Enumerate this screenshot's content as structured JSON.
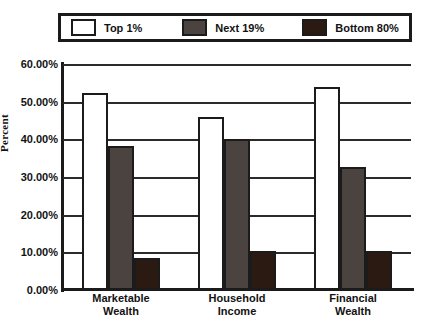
{
  "title_sliver": "Comparison",
  "legend": {
    "position": "top",
    "entries": [
      {
        "label": "Top 1%",
        "color": "#ffffff"
      },
      {
        "label": "Next 19%",
        "color": "#4a4340"
      },
      {
        "label": "Bottom 80%",
        "color": "#2a1a12"
      }
    ]
  },
  "axis": {
    "ylabel": "Percent",
    "yticks": [
      "60.00%",
      "50.00%",
      "40.00%",
      "30.00%",
      "20.00%",
      "10.00%",
      "0.00%"
    ]
  },
  "categories_display": [
    [
      "Marketable",
      "Wealth"
    ],
    [
      "Household",
      "Income"
    ],
    [
      "Financial",
      "Wealth"
    ]
  ],
  "chart_data": {
    "type": "bar",
    "title": "",
    "xlabel": "",
    "ylabel": "Percent",
    "ylim": [
      0,
      60
    ],
    "ytick_values": [
      0,
      10,
      20,
      30,
      40,
      50,
      60
    ],
    "ytick_labels": [
      "0.00%",
      "10.00%",
      "20.00%",
      "30.00%",
      "40.00%",
      "50.00%",
      "60.00%"
    ],
    "grid": true,
    "grid_axis": "y",
    "legend_position": "top",
    "categories": [
      "Marketable Wealth",
      "Household Income",
      "Financial Wealth"
    ],
    "series": [
      {
        "name": "Top 1%",
        "color": "#ffffff",
        "values": [
          52.3,
          46.0,
          54.0
        ]
      },
      {
        "name": "Next 19%",
        "color": "#4a4340",
        "values": [
          38.2,
          40.0,
          32.6
        ]
      },
      {
        "name": "Bottom 80%",
        "color": "#2a1a12",
        "values": [
          8.5,
          10.3,
          10.3
        ]
      }
    ]
  }
}
